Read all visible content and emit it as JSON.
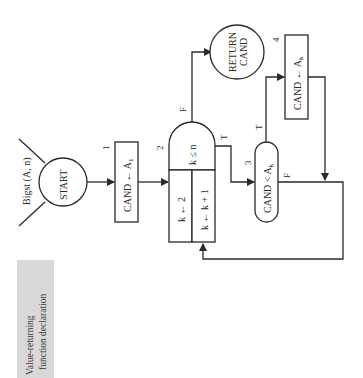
{
  "diagram": {
    "function_signature": "Bigst (A, n)",
    "start_label": "START",
    "return_label_line1": "RETURN",
    "return_label_line2": "CAND",
    "steps": [
      {
        "number": "1",
        "text": "CAND ← A",
        "sub": "1"
      },
      {
        "number": "2",
        "condition": "k ≤ n",
        "init": "k ← 2",
        "increment": "k ← k + 1"
      },
      {
        "number": "3",
        "text": "CAND < A",
        "sub": "k"
      },
      {
        "number": "4",
        "text": "CAND ← A",
        "sub": "k"
      }
    ],
    "branch_labels": {
      "loop_false": "F",
      "loop_true": "T",
      "compare_true": "T",
      "compare_false": "F"
    },
    "side_note_line1": "Value-returning",
    "side_note_line2": "function declaration",
    "colors": {
      "ink": "#2a2a2a",
      "note_bg": "#d9d9d9"
    }
  }
}
